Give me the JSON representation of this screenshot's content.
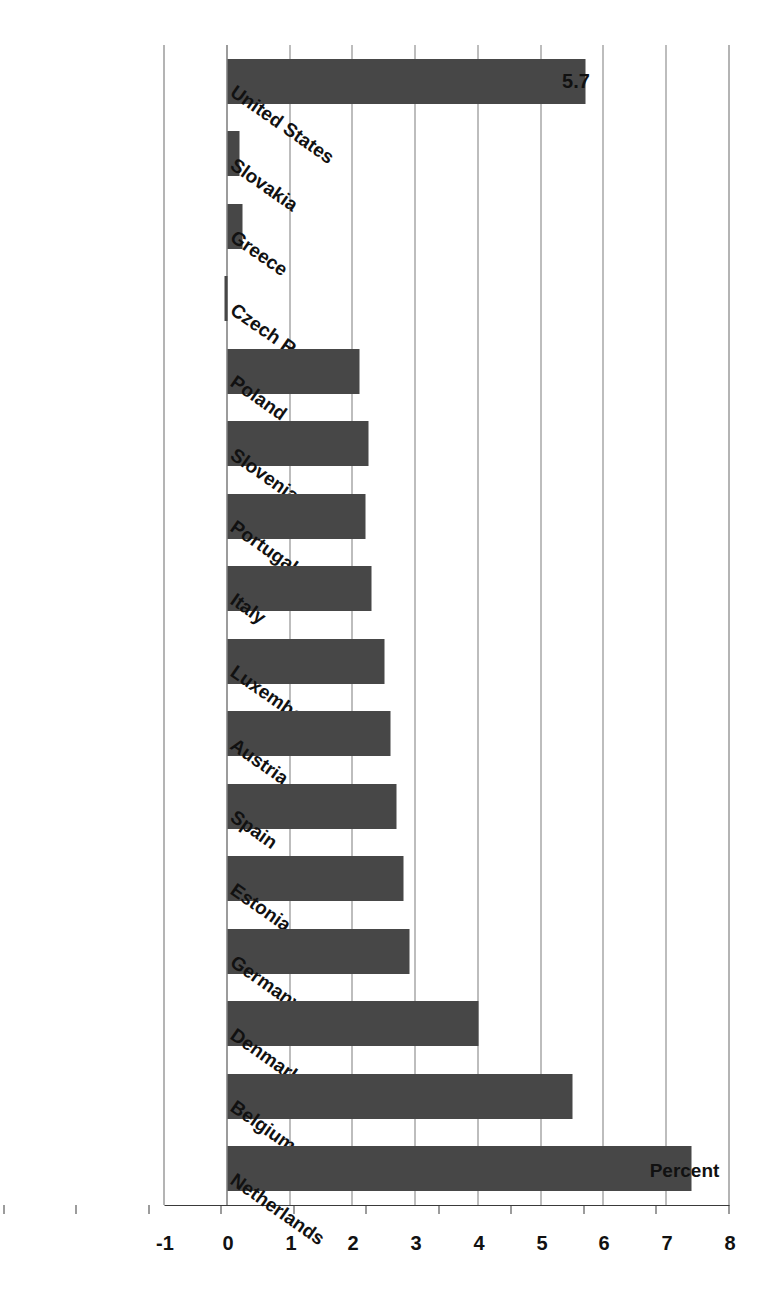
{
  "chart_data": {
    "type": "bar",
    "orientation": "horizontal",
    "title": "",
    "subtitle": "",
    "xlabel": "",
    "ylabel": "Percent",
    "axis_title": "Percent",
    "categories": [
      "United States",
      "Slovakia",
      "Greece",
      "Czech Republic",
      "Poland",
      "Slovenia",
      "Portugal",
      "Italy",
      "Luxembourg",
      "Austria",
      "Spain",
      "Estonia",
      "Germany",
      "Denmark",
      "Belgium",
      "Netherlands"
    ],
    "values": [
      5.7,
      0.2,
      0.25,
      -0.05,
      2.1,
      2.25,
      2.2,
      2.3,
      2.5,
      2.6,
      2.7,
      2.8,
      2.9,
      4.0,
      5.5,
      7.4
    ],
    "value_labels": [
      "5.7",
      "",
      "",
      "",
      "",
      "",
      "",
      "",
      "",
      "",
      "",
      "",
      "",
      "",
      "",
      ""
    ],
    "tick_labels": [
      "8",
      "7",
      "6",
      "5",
      "4",
      "3",
      "2",
      "1",
      "0",
      "-1"
    ],
    "ticks": [
      8,
      7,
      6,
      5,
      4,
      3,
      2,
      1,
      0,
      -1
    ],
    "ylim": [
      -1,
      8
    ],
    "grid": true,
    "legend": "none",
    "bar_color": "#474747",
    "gridline_color": "#7d7d7d",
    "axis_color": "#3a3a3a",
    "background": "#ffffff"
  }
}
